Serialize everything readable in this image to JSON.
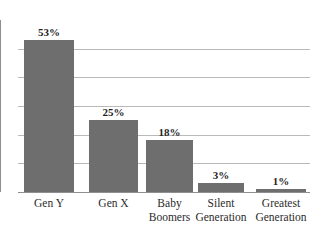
{
  "chart_data": {
    "type": "bar",
    "title": "",
    "subtitle": "",
    "xlabel": "",
    "ylabel": "",
    "categories": [
      "Gen Y",
      "Gen X",
      "Baby Boomers",
      "Silent Generation",
      "Greatest Generation"
    ],
    "category_lines": [
      [
        "Gen Y"
      ],
      [
        "Gen X"
      ],
      [
        "Baby",
        "Boomers"
      ],
      [
        "Silent",
        "Generation"
      ],
      [
        "Greatest",
        "Generation"
      ]
    ],
    "values": [
      53,
      25,
      18,
      3,
      1
    ],
    "data_labels": [
      "53%",
      "25%",
      "18%",
      "3%",
      "1%"
    ],
    "ylim": [
      0,
      60
    ],
    "gridlines": [
      10,
      20,
      30,
      40,
      50
    ],
    "grid": true,
    "legend": "none",
    "bar_color": "#6e6e6e",
    "grid_color": "#b9b9b9",
    "axis_color": "#8f8f8f",
    "background": "#ffffff"
  }
}
